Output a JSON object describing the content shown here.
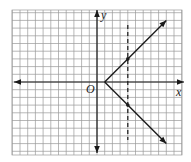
{
  "chart_data": {
    "type": "line",
    "title": "",
    "xlabel": "x",
    "ylabel": "y",
    "origin_label": "O",
    "xlim": [
      -11,
      11
    ],
    "ylim": [
      -9.5,
      9.3
    ],
    "grid": true,
    "grid_step": 1,
    "series": [
      {
        "name": "upper ray",
        "points": [
          [
            1,
            0
          ],
          [
            4,
            3
          ],
          [
            9,
            8
          ]
        ],
        "arrow_end": true,
        "style": "solid"
      },
      {
        "name": "lower ray",
        "points": [
          [
            1,
            0
          ],
          [
            4,
            -3
          ],
          [
            9,
            -8
          ]
        ],
        "arrow_end": true,
        "style": "solid"
      }
    ],
    "vertical_line": {
      "x": 4,
      "style": "dashed"
    },
    "marked_points": [
      [
        4,
        3
      ],
      [
        4,
        -3
      ]
    ],
    "vertex": [
      1,
      0
    ],
    "relation": "|y| = x - 1 (equivalently x = |y| + 1)"
  },
  "colors": {
    "grid": "#9a9a9a",
    "axis": "#1a1a1a",
    "curve": "#1a1a1a",
    "background": "#ffffff"
  }
}
